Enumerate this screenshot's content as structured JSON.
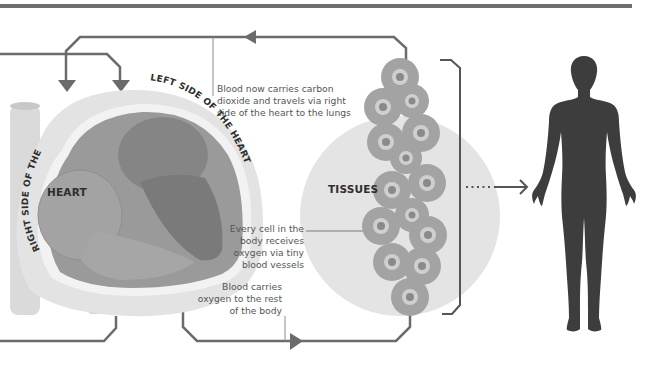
{
  "diagram": {
    "type": "circulation-flow",
    "labels": {
      "heart": "HEART",
      "tissues": "TISSUES",
      "left_side": "LEFT SIDE OF THE HEART",
      "right_side": "RIGHT SIDE OF THE HEART"
    },
    "annotations": {
      "carbon_dioxide": {
        "line1": "Blood now carries carbon",
        "line2": "dioxide and travels via right",
        "line3": "side of the heart to the lungs"
      },
      "every_cell": {
        "line1": "Every cell in the",
        "line2": "body receives",
        "line3": "oxygen via tiny",
        "line4": "blood vessels"
      },
      "oxygen": {
        "line1": "Blood carries",
        "line2": "oxygen to the rest",
        "line3": "of the body"
      }
    },
    "elements": [
      "top-rule",
      "heart-illustration",
      "tissue-circle",
      "cell-cluster",
      "bracket",
      "dotted-arrow",
      "human-silhouette",
      "return-loop-arrow",
      "outflow-arrow"
    ],
    "colors": {
      "flow_line": "#6b6b6b",
      "top_rule": "#6e6e6e",
      "heart_outer": "#e3e3e3",
      "heart_muscle": "#9a9a9a",
      "heart_chamber_dark": "#7d7d7d",
      "tissue_bg": "#e4e4e4",
      "cell_outer": "#a3a3a3",
      "cell_ring": "#cfcfcf",
      "cell_core": "#8a8a8a",
      "silhouette": "#3d3d3d",
      "text": "#555555",
      "label_bold": "#2e2e2e"
    }
  }
}
